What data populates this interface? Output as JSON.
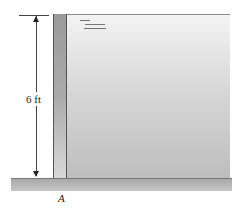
{
  "diagram": {
    "type": "retaining wall with water",
    "dimension": {
      "label": "6 ft"
    },
    "point": {
      "label": "A"
    },
    "colors": {
      "wall": "#9a9a9a",
      "water": "#d0d0d0",
      "ground": "#b5b5b5",
      "lines": "#444444"
    }
  }
}
